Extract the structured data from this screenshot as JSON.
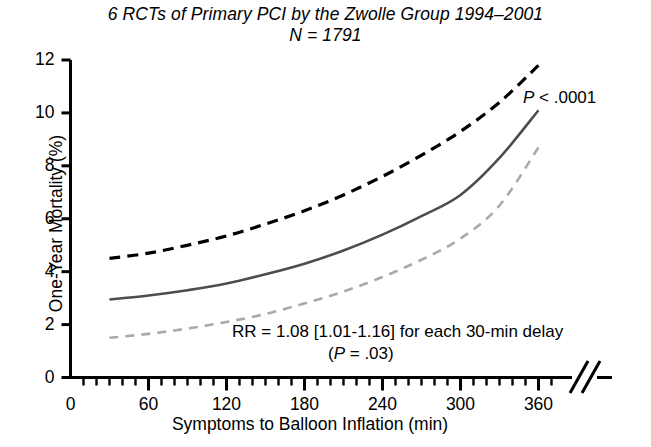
{
  "figure": {
    "title_line1": "6 RCTs of Primary PCI by the Zwolle Group 1994–2001",
    "title_line2": "N = 1791"
  },
  "annotations": {
    "p_value_prefix": "P",
    "p_value_rest": " < .0001",
    "rr_line1": "RR = 1.08 [1.01-1.16] for each 30-min delay",
    "rr_line2_open": "(",
    "rr_line2_p": "P",
    "rr_line2_rest": " = .03)"
  },
  "chart_data": {
    "type": "line",
    "title": "6 RCTs of Primary PCI by the Zwolle Group 1994–2001",
    "subtitle": "N = 1791",
    "xlabel": "Symptoms to Balloon Inflation (min)",
    "ylabel": "One-Year Mortality (%)",
    "xlim": [
      0,
      375
    ],
    "ylim": [
      0,
      12
    ],
    "xticks": [
      0,
      60,
      120,
      180,
      240,
      300,
      360
    ],
    "xtick_labels": [
      "0",
      "60",
      "120",
      "180",
      "240",
      "300",
      "360"
    ],
    "xminor_tick_interval": 10,
    "yticks": [
      0,
      2,
      4,
      6,
      8,
      10,
      12
    ],
    "ytick_labels": [
      "0",
      "2",
      "4",
      "6",
      "8",
      "10",
      "12"
    ],
    "grid": false,
    "legend": null,
    "axis_break": {
      "axis": "x",
      "position_min": 368,
      "style": "double-slash"
    },
    "x": [
      30,
      60,
      90,
      120,
      150,
      180,
      210,
      240,
      270,
      300,
      330,
      360
    ],
    "series": [
      {
        "name": "Upper 95% confidence limit",
        "style": "dashed",
        "color": "#000000",
        "linewidth": 3.2,
        "values": [
          4.5,
          4.7,
          5.0,
          5.35,
          5.8,
          6.3,
          6.9,
          7.6,
          8.4,
          9.3,
          10.4,
          11.8
        ]
      },
      {
        "name": "Predicted one-year mortality",
        "style": "solid",
        "color": "#4d4d4d",
        "linewidth": 2.6,
        "values": [
          2.95,
          3.1,
          3.3,
          3.55,
          3.9,
          4.3,
          4.8,
          5.4,
          6.1,
          6.9,
          8.3,
          10.1
        ]
      },
      {
        "name": "Lower 95% confidence limit",
        "style": "dashed",
        "color": "#aaaaaa",
        "linewidth": 2.6,
        "values": [
          1.5,
          1.65,
          1.85,
          2.1,
          2.4,
          2.8,
          3.25,
          3.8,
          4.45,
          5.25,
          6.5,
          8.7
        ]
      }
    ],
    "annotations": [
      {
        "text": "P < .0001",
        "x_min": 345,
        "y_pct": 10.9
      },
      {
        "text": "RR = 1.08 [1.01-1.16] for each 30-min delay",
        "x_min": 200,
        "y_pct": 2.1
      },
      {
        "text": "(P = .03)",
        "x_min": 250,
        "y_pct": 1.3
      }
    ]
  },
  "colors": {
    "axis": "#000000",
    "upper_band": "#000000",
    "central_line": "#4d4d4d",
    "lower_band": "#aaaaaa",
    "background": "#ffffff"
  }
}
